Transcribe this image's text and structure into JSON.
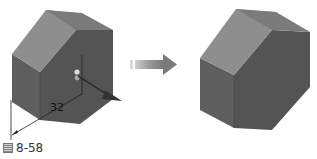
{
  "figure": {
    "caption_prefix": "图",
    "caption_number": "8-58",
    "dimension_value": "32",
    "colors": {
      "top_face": "#8f8f8f",
      "top_back_face": "#7a7a7a",
      "front_face": "#5a5a5a",
      "side_face": "#525252",
      "arrow": "#8a8a8a",
      "dimension_line": "#222222"
    },
    "panels": [
      {
        "name": "before",
        "description": "Hexagonal prism with extrusion dimension 32 and drag handle"
      },
      {
        "name": "after",
        "description": "Resulting hexagonal prism after extrusion"
      }
    ],
    "transition_arrow": "right-arrow"
  }
}
